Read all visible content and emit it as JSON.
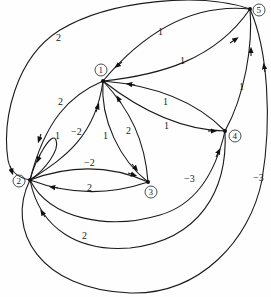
{
  "diagram": {
    "type": "weighted-directed-graph",
    "nodes": [
      {
        "id": "1",
        "label": "1",
        "x": 103,
        "y": 81
      },
      {
        "id": "2",
        "label": "2",
        "x": 30,
        "y": 180
      },
      {
        "id": "3",
        "label": "3",
        "x": 148,
        "y": 182
      },
      {
        "id": "4",
        "label": "4",
        "x": 225,
        "y": 131
      },
      {
        "id": "5",
        "label": "5",
        "x": 250,
        "y": 9
      }
    ],
    "edges": [
      {
        "from": "5",
        "to": "2",
        "weight": "2"
      },
      {
        "from": "5",
        "to": "1",
        "weight": "1"
      },
      {
        "from": "1",
        "to": "5",
        "weight": "1"
      },
      {
        "from": "4",
        "to": "1",
        "weight": "1"
      },
      {
        "from": "1",
        "to": "4",
        "weight": "1"
      },
      {
        "from": "4",
        "to": "5",
        "weight": "1"
      },
      {
        "from": "1",
        "to": "2",
        "weight": "2"
      },
      {
        "from": "2",
        "to": "1",
        "weight": "−2"
      },
      {
        "from": "2",
        "to": "2",
        "weight": "1"
      },
      {
        "from": "1",
        "to": "3",
        "weight": "1"
      },
      {
        "from": "3",
        "to": "1",
        "weight": "2"
      },
      {
        "from": "2",
        "to": "3",
        "weight": "−2"
      },
      {
        "from": "3",
        "to": "2",
        "weight": "2"
      },
      {
        "from": "2",
        "to": "4",
        "weight": "−3"
      },
      {
        "from": "4",
        "to": "2",
        "weight": "2"
      },
      {
        "from": "2",
        "to": "5",
        "weight": "−3"
      }
    ]
  }
}
